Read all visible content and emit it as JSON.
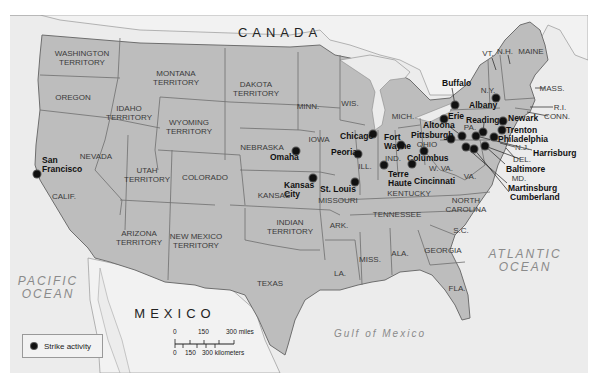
{
  "map": {
    "countries": [
      {
        "name": "CANADA",
        "x": 280,
        "y": 32
      },
      {
        "name": "MEXICO",
        "x": 175,
        "y": 313
      }
    ],
    "oceans": [
      {
        "name": "PACIFIC\nOCEAN",
        "line1": "PACIFIC",
        "line2": "OCEAN",
        "x": 48,
        "y": 288
      },
      {
        "name": "ATLANTIC\nOCEAN",
        "line1": "ATLANTIC",
        "line2": "OCEAN",
        "x": 525,
        "y": 261
      },
      {
        "name": "Gulf of Mexico",
        "line1": "Gulf of Mexico",
        "line2": "",
        "x": 380,
        "y": 333
      }
    ],
    "regions": [
      {
        "label": "WASHINGTON\nTERRITORY",
        "l1": "WASHINGTON",
        "l2": "TERRITORY",
        "x": 82,
        "y": 58
      },
      {
        "label": "OREGON",
        "l1": "OREGON",
        "l2": "",
        "x": 73,
        "y": 97
      },
      {
        "label": "IDAHO\nTERRITORY",
        "l1": "IDAHO",
        "l2": "TERRITORY",
        "x": 129,
        "y": 113
      },
      {
        "label": "MONTANA\nTERRITORY",
        "l1": "MONTANA",
        "l2": "TERRITORY",
        "x": 176,
        "y": 78
      },
      {
        "label": "WYOMING\nTERRITORY",
        "l1": "WYOMING",
        "l2": "TERRITORY",
        "x": 189,
        "y": 127
      },
      {
        "label": "DAKOTA\nTERRITORY",
        "l1": "DAKOTA",
        "l2": "TERRITORY",
        "x": 256,
        "y": 89
      },
      {
        "label": "NEBRASKA",
        "l1": "NEBRASKA",
        "l2": "",
        "x": 262,
        "y": 147
      },
      {
        "label": "NEVADA",
        "l1": "NEVADA",
        "l2": "",
        "x": 96,
        "y": 156
      },
      {
        "label": "UTAH\nTERRITORY",
        "l1": "UTAH",
        "l2": "TERRITORY",
        "x": 147,
        "y": 175
      },
      {
        "label": "COLORADO",
        "l1": "COLORADO",
        "l2": "",
        "x": 205,
        "y": 177
      },
      {
        "label": "CALIF.",
        "l1": "CALIF.",
        "l2": "",
        "x": 64,
        "y": 196
      },
      {
        "label": "KANSAS",
        "l1": "KANSAS",
        "l2": "",
        "x": 274,
        "y": 195
      },
      {
        "label": "ARIZONA\nTERRITORY",
        "l1": "ARIZONA",
        "l2": "TERRITORY",
        "x": 139,
        "y": 238
      },
      {
        "label": "NEW MEXICO\nTERRITORY",
        "l1": "NEW MEXICO",
        "l2": "TERRITORY",
        "x": 196,
        "y": 241
      },
      {
        "label": "INDIAN\nTERRITORY",
        "l1": "INDIAN",
        "l2": "TERRITORY",
        "x": 290,
        "y": 227
      },
      {
        "label": "TEXAS",
        "l1": "TEXAS",
        "l2": "",
        "x": 270,
        "y": 283
      },
      {
        "label": "MINN.",
        "l1": "MINN.",
        "l2": "",
        "x": 308,
        "y": 106
      },
      {
        "label": "WIS.",
        "l1": "WIS.",
        "l2": "",
        "x": 350,
        "y": 103
      },
      {
        "label": "IOWA",
        "l1": "IOWA",
        "l2": "",
        "x": 319,
        "y": 139
      },
      {
        "label": "MICH.",
        "l1": "MICH.",
        "l2": "",
        "x": 403,
        "y": 116
      },
      {
        "label": "ILL.",
        "l1": "ILL.",
        "l2": "",
        "x": 365,
        "y": 166
      },
      {
        "label": "IND.",
        "l1": "IND.",
        "l2": "",
        "x": 393,
        "y": 158
      },
      {
        "label": "OHIO",
        "l1": "OHIO",
        "l2": "",
        "x": 427,
        "y": 144
      },
      {
        "label": "MISSOURI",
        "l1": "MISSOURI",
        "l2": "",
        "x": 338,
        "y": 200
      },
      {
        "label": "KENTUCKY",
        "l1": "KENTUCKY",
        "l2": "",
        "x": 409,
        "y": 193
      },
      {
        "label": "W. VA.",
        "l1": "W. VA.",
        "l2": "",
        "x": 441,
        "y": 168
      },
      {
        "label": "VA.",
        "l1": "VA.",
        "l2": "",
        "x": 470,
        "y": 176
      },
      {
        "label": "TENNESSEE",
        "l1": "TENNESSEE",
        "l2": "",
        "x": 397,
        "y": 214
      },
      {
        "label": "NORTH\nCAROLINA",
        "l1": "NORTH",
        "l2": "CAROLINA",
        "x": 466,
        "y": 205
      },
      {
        "label": "ARK.",
        "l1": "ARK.",
        "l2": "",
        "x": 339,
        "y": 225
      },
      {
        "label": "S.C.",
        "l1": "S.C.",
        "l2": "",
        "x": 461,
        "y": 230
      },
      {
        "label": "MISS.",
        "l1": "MISS.",
        "l2": "",
        "x": 370,
        "y": 259
      },
      {
        "label": "ALA.",
        "l1": "ALA.",
        "l2": "",
        "x": 400,
        "y": 253
      },
      {
        "label": "GEORGIA",
        "l1": "GEORGIA",
        "l2": "",
        "x": 443,
        "y": 250
      },
      {
        "label": "LA.",
        "l1": "LA.",
        "l2": "",
        "x": 340,
        "y": 273
      },
      {
        "label": "FLA.",
        "l1": "FLA.",
        "l2": "",
        "x": 457,
        "y": 288
      },
      {
        "label": "N.Y.",
        "l1": "N.Y.",
        "l2": "",
        "x": 488,
        "y": 90
      },
      {
        "label": "PA.",
        "l1": "PA.",
        "l2": "",
        "x": 470,
        "y": 127
      },
      {
        "label": "VT.",
        "l1": "VT.",
        "l2": "",
        "x": 488,
        "y": 53
      },
      {
        "label": "N.H.",
        "l1": "N.H.",
        "l2": "",
        "x": 505,
        "y": 51
      },
      {
        "label": "MAINE",
        "l1": "MAINE",
        "l2": "",
        "x": 531,
        "y": 51
      },
      {
        "label": "MASS.",
        "l1": "MASS.",
        "l2": "",
        "x": 552,
        "y": 88
      },
      {
        "label": "R.I.",
        "l1": "R.I.",
        "l2": "",
        "x": 560,
        "y": 107
      },
      {
        "label": "CONN.",
        "l1": "CONN.",
        "l2": "",
        "x": 557,
        "y": 116
      },
      {
        "label": "N.J.",
        "l1": "N.J.",
        "l2": "",
        "x": 522,
        "y": 147
      },
      {
        "label": "DEL.",
        "l1": "DEL.",
        "l2": "",
        "x": 522,
        "y": 159
      },
      {
        "label": "MD.",
        "l1": "MD.",
        "l2": "",
        "x": 519,
        "y": 178
      }
    ],
    "strike_cities": [
      {
        "name": "San Francisco",
        "l1": "San",
        "l2": "Francisco",
        "dot_x": 37,
        "dot_y": 174,
        "lx": 42,
        "ly": 156
      },
      {
        "name": "Omaha",
        "l1": "Omaha",
        "l2": "",
        "dot_x": 296,
        "dot_y": 151,
        "lx": 270,
        "ly": 153
      },
      {
        "name": "Kansas City",
        "l1": "Kansas",
        "l2": "City",
        "dot_x": 313,
        "dot_y": 178,
        "lx": 284,
        "ly": 181
      },
      {
        "name": "St. Louis",
        "l1": "St. Louis",
        "l2": "",
        "dot_x": 355,
        "dot_y": 182,
        "lx": 320,
        "ly": 185
      },
      {
        "name": "Chicago",
        "l1": "Chicago",
        "l2": "",
        "dot_x": 373,
        "dot_y": 134,
        "lx": 340,
        "ly": 132
      },
      {
        "name": "Peoria",
        "l1": "Peoria",
        "l2": "",
        "dot_x": 358,
        "dot_y": 154,
        "lx": 331,
        "ly": 148
      },
      {
        "name": "Fort Wayne",
        "l1": "Fort",
        "l2": "Wayne",
        "dot_x": 401,
        "dot_y": 145,
        "lx": 384,
        "ly": 133
      },
      {
        "name": "Terre Haute",
        "l1": "Terre",
        "l2": "Haute",
        "dot_x": 384,
        "dot_y": 165,
        "lx": 388,
        "ly": 170
      },
      {
        "name": "Columbus",
        "l1": "Columbus",
        "l2": "",
        "dot_x": 424,
        "dot_y": 151,
        "lx": 407,
        "ly": 154
      },
      {
        "name": "Cincinnati",
        "l1": "Cincinnati",
        "l2": "",
        "dot_x": 412,
        "dot_y": 164,
        "lx": 414,
        "ly": 177
      },
      {
        "name": "Buffalo",
        "l1": "Buffalo",
        "l2": "",
        "dot_x": 455,
        "dot_y": 105,
        "lx": 442,
        "ly": 79
      },
      {
        "name": "Albany",
        "l1": "Albany",
        "l2": "",
        "dot_x": 496,
        "dot_y": 98,
        "lx": 469,
        "ly": 101
      },
      {
        "name": "Erie",
        "l1": "Erie",
        "l2": "",
        "dot_x": 444,
        "dot_y": 119,
        "lx": 448,
        "ly": 112
      },
      {
        "name": "Altoona",
        "l1": "Altoona",
        "l2": "",
        "dot_x": 462,
        "dot_y": 136,
        "lx": 423,
        "ly": 121
      },
      {
        "name": "Pittsburgh",
        "l1": "Pittsburgh",
        "l2": "",
        "dot_x": 451,
        "dot_y": 139,
        "lx": 411,
        "ly": 131
      },
      {
        "name": "Reading",
        "l1": "Reading",
        "l2": "",
        "dot_x": 483,
        "dot_y": 132,
        "lx": 466,
        "ly": 116
      },
      {
        "name": "Newark",
        "l1": "Newark",
        "l2": "",
        "dot_x": 503,
        "dot_y": 121,
        "lx": 508,
        "ly": 114
      },
      {
        "name": "Trenton",
        "l1": "Trenton",
        "l2": "",
        "dot_x": 502,
        "dot_y": 130,
        "lx": 506,
        "ly": 126
      },
      {
        "name": "Philadelphia",
        "l1": "Philadelphia",
        "l2": "",
        "dot_x": 494,
        "dot_y": 137,
        "lx": 498,
        "ly": 135
      },
      {
        "name": "Harrisburg",
        "l1": "Harrisburg",
        "l2": "",
        "dot_x": 476,
        "dot_y": 136,
        "lx": 533,
        "ly": 149
      },
      {
        "name": "Baltimore",
        "l1": "Baltimore",
        "l2": "",
        "dot_x": 485,
        "dot_y": 146,
        "lx": 506,
        "ly": 165
      },
      {
        "name": "Martinsburg",
        "l1": "Martinsburg",
        "l2": "",
        "dot_x": 466,
        "dot_y": 147,
        "lx": 508,
        "ly": 184
      },
      {
        "name": "Cumberland",
        "l1": "Cumberland",
        "l2": "",
        "dot_x": 474,
        "dot_y": 149,
        "lx": 510,
        "ly": 193
      }
    ]
  },
  "legend": {
    "label": "Strike activity"
  },
  "scale_bar": {
    "miles_0": "0",
    "miles_150": "150",
    "miles_300": "300 miles",
    "km_0": "0",
    "km_150": "150",
    "km_300": "300 kilometers"
  },
  "colors": {
    "land_us": "#bdbdbd",
    "land_foreign": "#f2f2f2",
    "water": "#e6e6e6",
    "border": "#6e6e6e",
    "strike_dot": "#111111"
  }
}
